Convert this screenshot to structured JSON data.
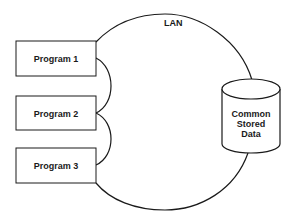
{
  "diagram": {
    "type": "network-topology",
    "network": {
      "label": "LAN",
      "shape": "circle"
    },
    "programs": [
      {
        "label": "Program 1"
      },
      {
        "label": "Program 2"
      },
      {
        "label": "Program 3"
      }
    ],
    "storage": {
      "shape": "cylinder",
      "lines": [
        "Common",
        "Stored",
        "Data"
      ]
    },
    "colors": {
      "stroke": "#1a1a1a",
      "background": "#ffffff"
    }
  }
}
